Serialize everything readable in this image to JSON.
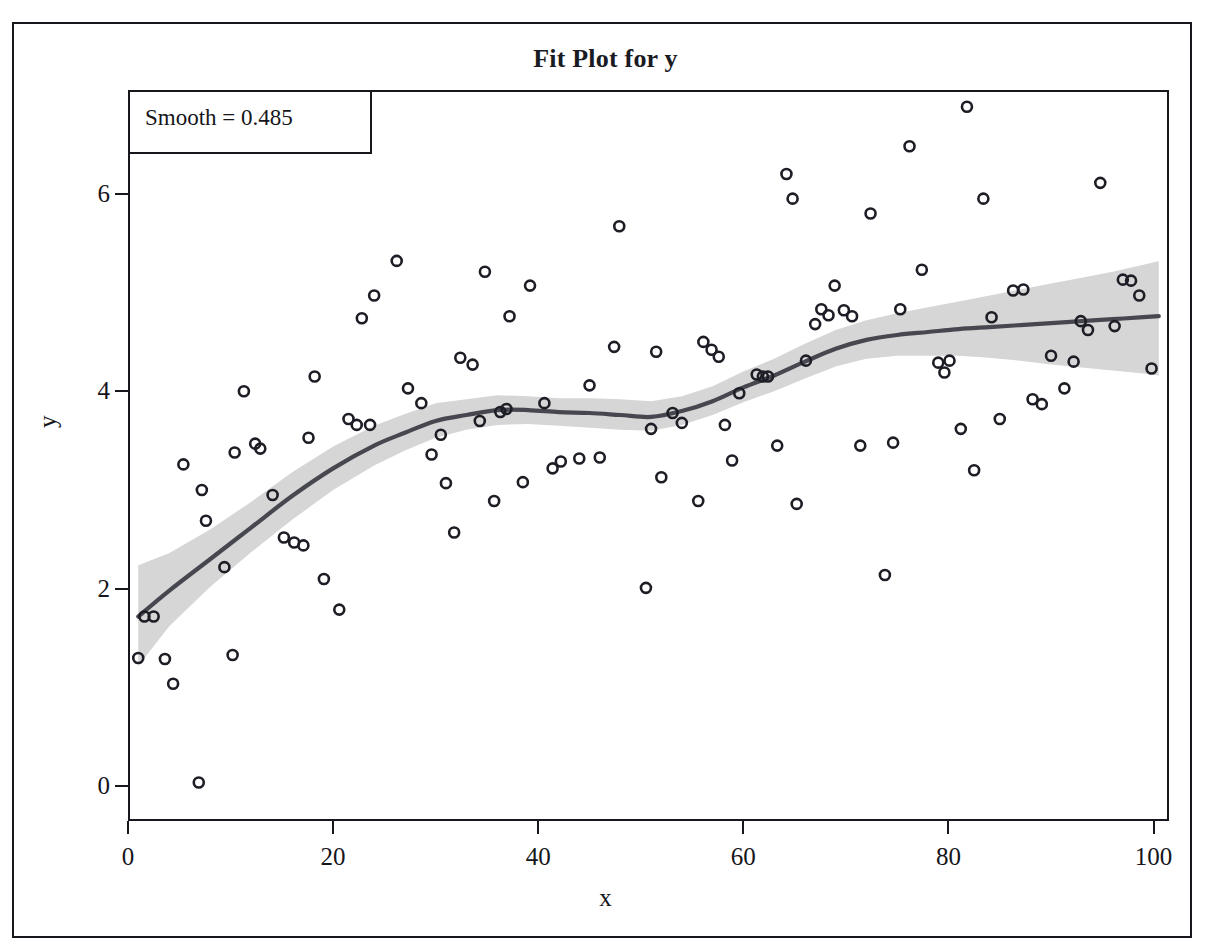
{
  "title": "Fit Plot for y",
  "legend": {
    "text": "Smooth = 0.485"
  },
  "axis": {
    "x_title": "x",
    "y_title": "y",
    "x_ticks": [
      "0",
      "20",
      "40",
      "60",
      "80",
      "100"
    ],
    "y_ticks": [
      "0",
      "2",
      "4",
      "6"
    ]
  },
  "colors": {
    "frame": "#17171e",
    "text": "#15151a",
    "fit_line": "#474750",
    "confidence_band": "#d6d6d6",
    "marker_stroke": "#1d1d26",
    "background": "#ffffff"
  },
  "chart_data": {
    "type": "scatter",
    "title": "Fit Plot for y",
    "xlabel": "x",
    "ylabel": "y",
    "xlim": [
      0,
      101.5
    ],
    "ylim": [
      -0.35,
      7.05
    ],
    "grid": false,
    "legend_position": "top-left",
    "annotations": [
      "Smooth = 0.485"
    ],
    "marker": {
      "shape": "circle",
      "filled": false,
      "size_px": 12
    },
    "points": [
      {
        "x": 1.0,
        "y": 1.3
      },
      {
        "x": 1.6,
        "y": 1.72
      },
      {
        "x": 2.5,
        "y": 1.72
      },
      {
        "x": 3.6,
        "y": 1.29
      },
      {
        "x": 4.4,
        "y": 1.04
      },
      {
        "x": 5.4,
        "y": 3.26
      },
      {
        "x": 6.9,
        "y": 0.04
      },
      {
        "x": 7.2,
        "y": 3.0
      },
      {
        "x": 7.6,
        "y": 2.69
      },
      {
        "x": 9.4,
        "y": 2.22
      },
      {
        "x": 10.2,
        "y": 1.33
      },
      {
        "x": 10.4,
        "y": 3.38
      },
      {
        "x": 11.3,
        "y": 4.0
      },
      {
        "x": 12.4,
        "y": 3.47
      },
      {
        "x": 12.9,
        "y": 3.42
      },
      {
        "x": 14.1,
        "y": 2.95
      },
      {
        "x": 15.2,
        "y": 2.52
      },
      {
        "x": 16.2,
        "y": 2.47
      },
      {
        "x": 17.1,
        "y": 2.44
      },
      {
        "x": 17.6,
        "y": 3.53
      },
      {
        "x": 18.2,
        "y": 4.15
      },
      {
        "x": 19.1,
        "y": 2.1
      },
      {
        "x": 20.6,
        "y": 1.79
      },
      {
        "x": 21.5,
        "y": 3.72
      },
      {
        "x": 22.3,
        "y": 3.66
      },
      {
        "x": 22.8,
        "y": 4.74
      },
      {
        "x": 23.6,
        "y": 3.66
      },
      {
        "x": 24.0,
        "y": 4.97
      },
      {
        "x": 26.2,
        "y": 5.32
      },
      {
        "x": 27.3,
        "y": 4.03
      },
      {
        "x": 28.6,
        "y": 3.88
      },
      {
        "x": 29.6,
        "y": 3.36
      },
      {
        "x": 30.5,
        "y": 3.56
      },
      {
        "x": 31.0,
        "y": 3.07
      },
      {
        "x": 31.8,
        "y": 2.57
      },
      {
        "x": 32.4,
        "y": 4.34
      },
      {
        "x": 33.6,
        "y": 4.27
      },
      {
        "x": 34.3,
        "y": 3.7
      },
      {
        "x": 34.8,
        "y": 5.21
      },
      {
        "x": 35.7,
        "y": 2.89
      },
      {
        "x": 36.3,
        "y": 3.79
      },
      {
        "x": 36.9,
        "y": 3.82
      },
      {
        "x": 37.2,
        "y": 4.76
      },
      {
        "x": 38.5,
        "y": 3.08
      },
      {
        "x": 39.2,
        "y": 5.07
      },
      {
        "x": 40.6,
        "y": 3.88
      },
      {
        "x": 41.4,
        "y": 3.22
      },
      {
        "x": 42.2,
        "y": 3.29
      },
      {
        "x": 44.0,
        "y": 3.32
      },
      {
        "x": 45.0,
        "y": 4.06
      },
      {
        "x": 46.0,
        "y": 3.33
      },
      {
        "x": 47.4,
        "y": 4.45
      },
      {
        "x": 47.9,
        "y": 5.67
      },
      {
        "x": 50.5,
        "y": 2.01
      },
      {
        "x": 51.0,
        "y": 3.62
      },
      {
        "x": 51.5,
        "y": 4.4
      },
      {
        "x": 52.0,
        "y": 3.13
      },
      {
        "x": 53.1,
        "y": 3.78
      },
      {
        "x": 54.0,
        "y": 3.68
      },
      {
        "x": 55.6,
        "y": 2.89
      },
      {
        "x": 56.1,
        "y": 4.5
      },
      {
        "x": 56.9,
        "y": 4.42
      },
      {
        "x": 57.6,
        "y": 4.35
      },
      {
        "x": 58.2,
        "y": 3.66
      },
      {
        "x": 58.9,
        "y": 3.3
      },
      {
        "x": 59.6,
        "y": 3.98
      },
      {
        "x": 61.3,
        "y": 4.17
      },
      {
        "x": 61.9,
        "y": 4.15
      },
      {
        "x": 62.4,
        "y": 4.15
      },
      {
        "x": 63.3,
        "y": 3.45
      },
      {
        "x": 64.2,
        "y": 6.2
      },
      {
        "x": 64.8,
        "y": 5.95
      },
      {
        "x": 65.2,
        "y": 2.86
      },
      {
        "x": 66.1,
        "y": 4.31
      },
      {
        "x": 67.0,
        "y": 4.68
      },
      {
        "x": 67.6,
        "y": 4.83
      },
      {
        "x": 68.3,
        "y": 4.77
      },
      {
        "x": 68.9,
        "y": 5.07
      },
      {
        "x": 69.8,
        "y": 4.82
      },
      {
        "x": 70.6,
        "y": 4.76
      },
      {
        "x": 71.4,
        "y": 3.45
      },
      {
        "x": 72.4,
        "y": 5.8
      },
      {
        "x": 73.8,
        "y": 2.14
      },
      {
        "x": 74.6,
        "y": 3.48
      },
      {
        "x": 75.3,
        "y": 4.83
      },
      {
        "x": 76.2,
        "y": 6.48
      },
      {
        "x": 77.4,
        "y": 5.23
      },
      {
        "x": 79.0,
        "y": 4.29
      },
      {
        "x": 79.6,
        "y": 4.19
      },
      {
        "x": 80.1,
        "y": 4.31
      },
      {
        "x": 81.2,
        "y": 3.62
      },
      {
        "x": 81.8,
        "y": 6.88
      },
      {
        "x": 82.5,
        "y": 3.2
      },
      {
        "x": 83.4,
        "y": 5.95
      },
      {
        "x": 84.2,
        "y": 4.75
      },
      {
        "x": 85.0,
        "y": 3.72
      },
      {
        "x": 86.3,
        "y": 5.02
      },
      {
        "x": 87.3,
        "y": 5.03
      },
      {
        "x": 88.2,
        "y": 3.92
      },
      {
        "x": 89.1,
        "y": 3.87
      },
      {
        "x": 90.0,
        "y": 4.36
      },
      {
        "x": 91.3,
        "y": 4.03
      },
      {
        "x": 92.2,
        "y": 4.3
      },
      {
        "x": 92.9,
        "y": 4.71
      },
      {
        "x": 93.6,
        "y": 4.62
      },
      {
        "x": 94.8,
        "y": 6.11
      },
      {
        "x": 96.2,
        "y": 4.66
      },
      {
        "x": 97.0,
        "y": 5.13
      },
      {
        "x": 97.8,
        "y": 5.12
      },
      {
        "x": 98.6,
        "y": 4.97
      },
      {
        "x": 99.8,
        "y": 4.23
      }
    ],
    "fit_line": {
      "name": "Loess fit",
      "x": [
        1.0,
        4,
        8,
        12,
        16,
        20,
        24,
        27,
        30,
        33,
        36,
        39,
        42,
        45,
        48,
        51,
        54,
        57,
        60,
        63,
        66,
        69,
        72,
        75,
        78,
        81,
        84,
        87,
        90,
        93,
        96,
        99,
        100.5
      ],
      "y": [
        1.72,
        1.98,
        2.3,
        2.62,
        2.94,
        3.22,
        3.45,
        3.58,
        3.7,
        3.76,
        3.81,
        3.81,
        3.79,
        3.78,
        3.76,
        3.74,
        3.8,
        3.9,
        4.04,
        4.16,
        4.3,
        4.43,
        4.52,
        4.57,
        4.6,
        4.63,
        4.65,
        4.67,
        4.69,
        4.71,
        4.73,
        4.75,
        4.76
      ]
    },
    "confidence_band": {
      "name": "95% confidence limits",
      "x": [
        1.0,
        4,
        8,
        12,
        16,
        20,
        24,
        27,
        30,
        33,
        36,
        39,
        42,
        45,
        48,
        51,
        54,
        57,
        60,
        63,
        66,
        69,
        72,
        75,
        78,
        81,
        84,
        87,
        90,
        93,
        96,
        99,
        100.5
      ],
      "lower": [
        1.22,
        1.62,
        2.02,
        2.37,
        2.7,
        3.0,
        3.25,
        3.4,
        3.53,
        3.61,
        3.66,
        3.67,
        3.65,
        3.63,
        3.61,
        3.6,
        3.66,
        3.76,
        3.89,
        4.0,
        4.13,
        4.25,
        4.33,
        4.36,
        4.36,
        4.36,
        4.34,
        4.31,
        4.27,
        4.24,
        4.21,
        4.18,
        4.16
      ],
      "upper": [
        2.24,
        2.36,
        2.6,
        2.88,
        3.18,
        3.44,
        3.65,
        3.77,
        3.88,
        3.92,
        3.96,
        3.95,
        3.93,
        3.93,
        3.92,
        3.9,
        3.95,
        4.05,
        4.2,
        4.33,
        4.48,
        4.62,
        4.72,
        4.79,
        4.85,
        4.91,
        4.97,
        5.03,
        5.09,
        5.15,
        5.21,
        5.28,
        5.32
      ]
    }
  }
}
